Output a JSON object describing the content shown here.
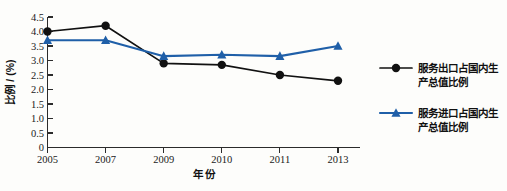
{
  "chart_data": {
    "type": "line",
    "title": "",
    "subtitle": "",
    "xlabel": "年 份",
    "ylabel": "比例 / (%)",
    "categories": [
      "2005",
      "2007",
      "2009",
      "2010",
      "2011",
      "2013"
    ],
    "x": [
      "2005",
      "2007",
      "2009",
      "2010",
      "2011",
      "2013"
    ],
    "series": [
      {
        "name": "服务出口占国内生产总值比例",
        "marker": "circle",
        "color": "#111111",
        "values": [
          4.0,
          4.2,
          2.9,
          2.85,
          2.5,
          2.3
        ]
      },
      {
        "name": "服务进口占国内生产总值比例",
        "marker": "triangle",
        "color": "#1f5fa8",
        "values": [
          3.7,
          3.7,
          3.15,
          3.2,
          3.15,
          3.5
        ]
      }
    ],
    "ylim": [
      0,
      4.5
    ],
    "y_ticks": [
      0,
      0.5,
      1.0,
      1.5,
      2.0,
      2.5,
      3.0,
      3.5,
      4.0,
      4.5
    ],
    "y_tick_labels": [
      "0",
      "0.5",
      "1.0",
      "1.5",
      "2.0",
      "2.5",
      "3.0",
      "3.5",
      "4.0",
      "4.5"
    ],
    "x_tick_labels": [
      "2005",
      "2007",
      "2009",
      "2010",
      "2011",
      "2013"
    ],
    "grid": false,
    "legend_position": "right",
    "legend": [
      {
        "label_line1": "服务出口占国内生",
        "label_line2": "产总值比例",
        "full_label": "服务出口占国内生产总值比例",
        "marker": "circle",
        "color": "#111111"
      },
      {
        "label_line1": "服务进口占国内生",
        "label_line2": "产总值比例",
        "full_label": "服务进口占国内生产总值比例",
        "marker": "triangle",
        "color": "#1f5fa8"
      }
    ]
  },
  "colors": {
    "series_a": "#111111",
    "series_b": "#1f5fa8",
    "axis": "#2b2b2b",
    "background": "#fdfdfb"
  }
}
